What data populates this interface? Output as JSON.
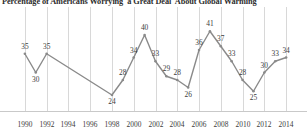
{
  "chart_data": {
    "type": "line",
    "title": "Percentage of Americans Worrying 'a Great Deal' About Global Warming",
    "xlabel": "",
    "ylabel": "",
    "ylim": [
      20,
      44
    ],
    "xlim": [
      1989,
      2015
    ],
    "grid": true,
    "legend": false,
    "line_color": "#8a8a8a",
    "grid_color": "#d8d8d8",
    "label_color": "#3b3b3b",
    "x_tick_labels": [
      "1990",
      "1992",
      "1994",
      "1996",
      "1998",
      "2000",
      "2002",
      "2004",
      "2006",
      "2008",
      "2010",
      "2012",
      "2014"
    ],
    "x_tick_years": [
      1990,
      1992,
      1994,
      1996,
      1998,
      2000,
      2002,
      2004,
      2006,
      2008,
      2010,
      2012,
      2014
    ],
    "points": [
      {
        "year": 1990,
        "value": 35
      },
      {
        "year": 1991,
        "value": 30
      },
      {
        "year": 1992,
        "value": 35
      },
      {
        "year": 1998,
        "value": 24
      },
      {
        "year": 1999,
        "value": 28
      },
      {
        "year": 2000,
        "value": 34
      },
      {
        "year": 2001,
        "value": 40
      },
      {
        "year": 2002,
        "value": 33
      },
      {
        "year": 2003,
        "value": 29
      },
      {
        "year": 2004,
        "value": 28
      },
      {
        "year": 2005,
        "value": 26
      },
      {
        "year": 2006,
        "value": 36
      },
      {
        "year": 2007,
        "value": 41
      },
      {
        "year": 2008,
        "value": 37
      },
      {
        "year": 2009,
        "value": 33
      },
      {
        "year": 2010,
        "value": 28
      },
      {
        "year": 2011,
        "value": 25
      },
      {
        "year": 2012,
        "value": 30
      },
      {
        "year": 2013,
        "value": 33
      },
      {
        "year": 2014,
        "value": 34
      }
    ],
    "x": [
      1990,
      1991,
      1992,
      1998,
      1999,
      2000,
      2001,
      2002,
      2003,
      2004,
      2005,
      2006,
      2007,
      2008,
      2009,
      2010,
      2011,
      2012,
      2013,
      2014
    ],
    "values": [
      35,
      30,
      35,
      24,
      28,
      34,
      40,
      33,
      29,
      28,
      26,
      36,
      41,
      37,
      33,
      28,
      25,
      30,
      33,
      34
    ]
  }
}
